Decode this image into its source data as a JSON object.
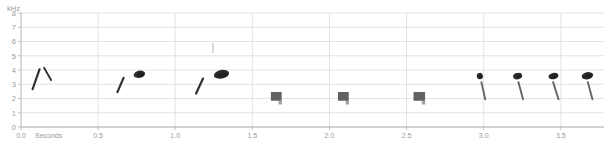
{
  "chart_data": {
    "type": "heatmap",
    "title": "",
    "subtitle": "",
    "xlabel": "Seconds",
    "ylabel": "kHz",
    "xlim": [
      0.0,
      3.78
    ],
    "ylim": [
      0,
      8
    ],
    "grid": true,
    "legend_position": "none",
    "xticks": [
      {
        "value": 0.0,
        "label": "0.0"
      },
      {
        "value": 0.5,
        "label": "0.5"
      },
      {
        "value": 1.0,
        "label": "1.0"
      },
      {
        "value": 1.5,
        "label": "1.5"
      },
      {
        "value": 2.0,
        "label": "2.0"
      },
      {
        "value": 2.5,
        "label": "2.5"
      },
      {
        "value": 3.0,
        "label": "3.0"
      },
      {
        "value": 3.5,
        "label": "3.5"
      }
    ],
    "yticks": [
      {
        "value": 8,
        "label": "8"
      },
      {
        "value": 7,
        "label": "7"
      },
      {
        "value": 6,
        "label": "6"
      },
      {
        "value": 5,
        "label": "5"
      },
      {
        "value": 4,
        "label": "4"
      },
      {
        "value": 3,
        "label": "3"
      },
      {
        "value": 2,
        "label": "2"
      },
      {
        "value": 1,
        "label": "1"
      },
      {
        "value": 0,
        "label": "0"
      }
    ],
    "colors": {
      "background": "#ffffff",
      "gridline": "#dcdcdc",
      "axis": "#b4b4b4",
      "tick_text": "#9a9a9a",
      "energy_dark": "#1a1a1a",
      "energy_mid": "#555555",
      "energy_faint": "#c8c8c8"
    },
    "annotations": [
      {
        "name": "faint-vertical-mark",
        "t": 1.245,
        "f_low": 5.2,
        "f_high": 5.9,
        "intensity": "faint"
      }
    ],
    "elements": [
      {
        "name": "upsweep-1",
        "kind": "upsweep",
        "t_start": 0.075,
        "t_end": 0.12,
        "f_start": 2.65,
        "f_end": 4.05,
        "intensity": "dark"
      },
      {
        "name": "downsweep-1",
        "kind": "downsweep",
        "t_start": 0.15,
        "t_end": 0.195,
        "f_start": 4.15,
        "f_end": 3.3,
        "intensity": "dark"
      },
      {
        "name": "upsweep-2",
        "kind": "upsweep",
        "t_start": 0.625,
        "t_end": 0.665,
        "f_start": 2.45,
        "f_end": 3.45,
        "intensity": "dark"
      },
      {
        "name": "buzz-blob-1",
        "kind": "blob",
        "t_start": 0.73,
        "t_end": 0.805,
        "f_start": 3.45,
        "f_end": 3.95,
        "intensity": "dark"
      },
      {
        "name": "upsweep-3",
        "kind": "upsweep",
        "t_start": 1.135,
        "t_end": 1.18,
        "f_start": 2.35,
        "f_end": 3.4,
        "intensity": "dark"
      },
      {
        "name": "buzz-blob-2",
        "kind": "blob",
        "t_start": 1.25,
        "t_end": 1.35,
        "f_start": 3.4,
        "f_end": 4.0,
        "intensity": "dark"
      },
      {
        "name": "block-note-1",
        "kind": "block",
        "t_start": 1.62,
        "t_end": 1.69,
        "f_start": 1.85,
        "f_end": 2.45,
        "intensity": "mid"
      },
      {
        "name": "block-note-2",
        "kind": "block",
        "t_start": 2.055,
        "t_end": 2.125,
        "f_start": 1.85,
        "f_end": 2.45,
        "intensity": "mid"
      },
      {
        "name": "block-note-3",
        "kind": "block",
        "t_start": 2.545,
        "t_end": 2.62,
        "f_start": 1.85,
        "f_end": 2.45,
        "intensity": "mid"
      },
      {
        "name": "cluster-1-blob",
        "kind": "blob",
        "t_start": 2.955,
        "t_end": 2.995,
        "f_start": 3.35,
        "f_end": 3.8,
        "intensity": "dark"
      },
      {
        "name": "cluster-1-tail",
        "kind": "downsweep",
        "t_start": 2.985,
        "t_end": 3.01,
        "f_start": 3.15,
        "f_end": 1.95,
        "intensity": "mid"
      },
      {
        "name": "cluster-2-blob",
        "kind": "blob",
        "t_start": 3.19,
        "t_end": 3.25,
        "f_start": 3.35,
        "f_end": 3.8,
        "intensity": "dark"
      },
      {
        "name": "cluster-2-tail",
        "kind": "downsweep",
        "t_start": 3.225,
        "t_end": 3.255,
        "f_start": 3.15,
        "f_end": 1.95,
        "intensity": "mid"
      },
      {
        "name": "cluster-3-blob",
        "kind": "blob",
        "t_start": 3.42,
        "t_end": 3.485,
        "f_start": 3.35,
        "f_end": 3.8,
        "intensity": "dark"
      },
      {
        "name": "cluster-3-tail",
        "kind": "downsweep",
        "t_start": 3.45,
        "t_end": 3.485,
        "f_start": 3.15,
        "f_end": 1.95,
        "intensity": "mid"
      },
      {
        "name": "cluster-4-blob",
        "kind": "blob",
        "t_start": 3.635,
        "t_end": 3.71,
        "f_start": 3.35,
        "f_end": 3.85,
        "intensity": "dark"
      },
      {
        "name": "cluster-4-tail",
        "kind": "downsweep",
        "t_start": 3.675,
        "t_end": 3.705,
        "f_start": 3.15,
        "f_end": 1.95,
        "intensity": "mid"
      }
    ]
  }
}
